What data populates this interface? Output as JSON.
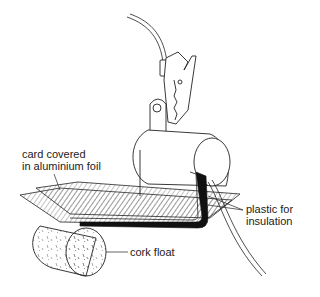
{
  "diagram": {
    "labels": {
      "card_line1": "card covered",
      "card_line2": "in aluminium foil",
      "plastic_line1": "plastic for",
      "plastic_line2": "insulation",
      "cork": "cork float"
    },
    "colors": {
      "ink": "#222222",
      "background": "#ffffff",
      "insulation": "#111111"
    }
  }
}
